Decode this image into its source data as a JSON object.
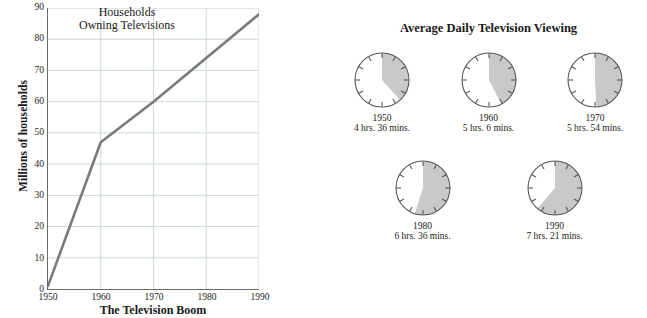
{
  "chart_data": [
    {
      "type": "line",
      "title": "Households\nOwning Televisions",
      "title_line1": "Households",
      "title_line2": "Owning Televisions",
      "caption": "The Television Boom",
      "xlabel": "",
      "ylabel": "Millions of households",
      "x": [
        1950,
        1960,
        1970,
        1980,
        1990
      ],
      "values": [
        1,
        47,
        60,
        74,
        88
      ],
      "categories": [
        "1950",
        "1960",
        "1970",
        "1980",
        "1990"
      ],
      "xlim": [
        1950,
        1990
      ],
      "ylim": [
        0,
        90
      ],
      "ytick_values": [
        0,
        10,
        20,
        30,
        40,
        50,
        60,
        70,
        80,
        90
      ],
      "ytick_labels": [
        "0",
        "10",
        "20",
        "30",
        "40",
        "50",
        "60",
        "70",
        "80",
        "90"
      ],
      "xtick_values": [
        1950,
        1960,
        1970,
        1980,
        1990
      ],
      "xtick_labels": [
        "1950",
        "1960",
        "1970",
        "1980",
        "1990"
      ],
      "grid": true,
      "grid_color": "#c8d2dc",
      "line_color": "#7a7a7a",
      "axis_color": "#6b6b6b",
      "legend": null
    },
    {
      "type": "pie",
      "title": "Average Daily Television Viewing",
      "units": "hours of a 12-hour clock face",
      "clock_total_hours": 12,
      "clocks": [
        {
          "year": "1950",
          "time_label": "4 hrs. 36 mins.",
          "hours": 4.6,
          "fraction": 0.3833
        },
        {
          "year": "1960",
          "time_label": "5 hrs. 6 mins.",
          "hours": 5.1,
          "fraction": 0.425
        },
        {
          "year": "1970",
          "time_label": "5 hrs. 54 mins.",
          "hours": 5.9,
          "fraction": 0.4917
        },
        {
          "year": "1980",
          "time_label": "6 hrs. 36 mins.",
          "hours": 6.6,
          "fraction": 0.55
        },
        {
          "year": "1990",
          "time_label": "7 hrs. 21 mins.",
          "hours": 7.35,
          "fraction": 0.6125
        }
      ],
      "slice_color": "#c9c9c9",
      "face_color": "#ffffff",
      "outline_color": "#555555"
    }
  ],
  "line_chart": {
    "title_line1": "Households",
    "title_line2": "Owning Televisions",
    "y_axis_title": "Millions of households",
    "caption": "The Television Boom"
  },
  "clocks_panel": {
    "title": "Average Daily Television Viewing"
  }
}
